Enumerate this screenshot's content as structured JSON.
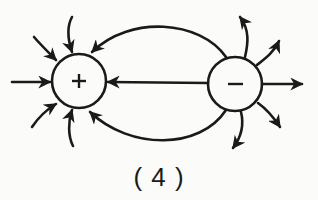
{
  "figure": {
    "caption": "( 4 )",
    "positive_charge": {
      "symbol": "+",
      "label": "positive charge"
    },
    "negative_charge": {
      "symbol": "−",
      "label": "negative charge"
    }
  },
  "colors": {
    "ink": "#1a1a1a",
    "background": "#fbfbf9"
  }
}
